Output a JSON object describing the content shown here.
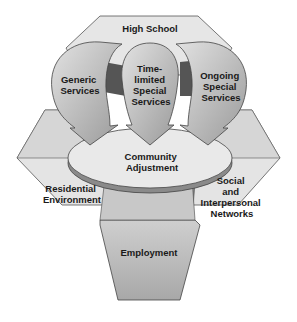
{
  "diagram": {
    "type": "transition-model",
    "top": {
      "label": "High School"
    },
    "services": [
      {
        "id": "generic",
        "lines": [
          "Generic",
          "Services"
        ]
      },
      {
        "id": "time-limited",
        "lines": [
          "Time-",
          "limited",
          "Special",
          "Services"
        ]
      },
      {
        "id": "ongoing",
        "lines": [
          "Ongoing",
          "Special",
          "Services"
        ]
      }
    ],
    "center": {
      "lines": [
        "Community",
        "Adjustment"
      ]
    },
    "outcomes": [
      {
        "id": "residential",
        "lines": [
          "Residential",
          "Environment"
        ]
      },
      {
        "id": "social",
        "lines": [
          "Social",
          "and",
          "Interpersonal",
          "Networks"
        ]
      },
      {
        "id": "employment",
        "lines": [
          "Employment"
        ]
      }
    ],
    "colors": {
      "background": "#ffffff",
      "hex_light": "#e6e6e6",
      "hex_side": "#d2d2d2",
      "arrow_fill": "#c4c4c4",
      "arrow_dark": "#555555",
      "disc_top": "#e9e9e9",
      "disc_edge": "#8a8a8a",
      "employment": "#bdbdbd",
      "stroke": "#444444",
      "text": "#1a1a1a"
    }
  }
}
